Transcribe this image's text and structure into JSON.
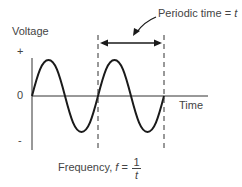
{
  "diagram": {
    "y_axis_label": "Voltage",
    "x_axis_label": "Time",
    "y_ticks": {
      "plus": "+",
      "zero": "0",
      "minus": "-"
    },
    "period_label_prefix": "Periodic time = ",
    "period_symbol": "t",
    "frequency_prefix": "Frequency, ",
    "frequency_symbol": "f",
    "frequency_equals": " = ",
    "fraction_numerator": "1",
    "fraction_denominator": "t",
    "cycles_shown": 2,
    "colors": {
      "curve": "#1a1a1a",
      "axis": "#333333",
      "text": "#444444"
    }
  }
}
